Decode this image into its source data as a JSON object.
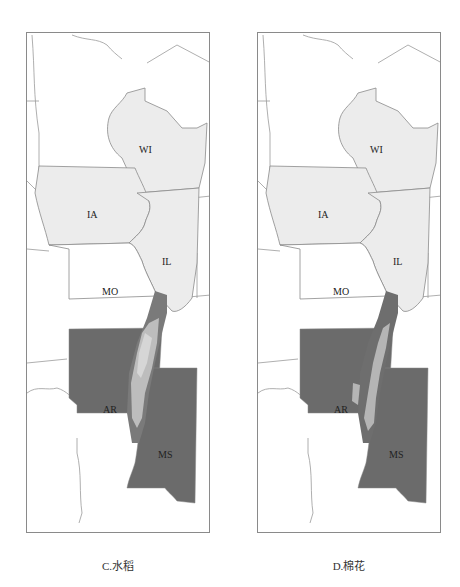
{
  "figure": {
    "panels": [
      {
        "id": "C",
        "caption": "C.水稻",
        "states": {
          "WI": "WI",
          "IA": "IA",
          "IL": "IL",
          "MO": "MO",
          "AR": "AR",
          "MS": "MS"
        }
      },
      {
        "id": "D",
        "caption": "D.棉花",
        "states": {
          "WI": "WI",
          "IA": "IA",
          "IL": "IL",
          "MO": "MO",
          "AR": "AR",
          "MS": "MS"
        }
      }
    ],
    "colors": {
      "light_state_fill": "#ececec",
      "dark_state_fill": "#6b6b6b",
      "highlight_fill": "#bdbdbd",
      "border": "#8a8a8a",
      "background": "#ffffff"
    }
  }
}
